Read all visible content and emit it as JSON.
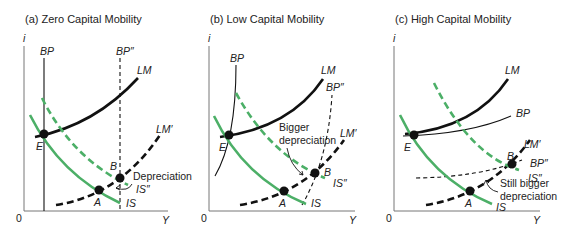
{
  "colors": {
    "is_curve": "#4caf67",
    "lm_curve": "#111111",
    "axis": "#777777"
  },
  "panels": [
    {
      "title": "(a) Zero Capital Mobility",
      "y_axis": "i",
      "x_axis": "Y",
      "origin": "0",
      "curves": {
        "bp": "BP",
        "bp2": "BP″",
        "lm": "LM",
        "lm2": "LM′",
        "is": "IS",
        "is2": "IS″"
      },
      "points": {
        "e": "E",
        "a": "A",
        "b": "B"
      },
      "note": "Depreciation"
    },
    {
      "title": "(b) Low Capital Mobility",
      "y_axis": "i",
      "x_axis": "Y",
      "origin": "0",
      "curves": {
        "bp": "BP",
        "bp2": "BP″",
        "lm": "LM",
        "lm2": "LM′",
        "is": "IS",
        "is2": "IS″"
      },
      "points": {
        "e": "E",
        "a": "A",
        "b": "B"
      },
      "note_line1": "Bigger",
      "note_line2": "depreciation"
    },
    {
      "title": "(c) High Capital Mobility",
      "y_axis": "i",
      "x_axis": "Y",
      "origin": "0",
      "curves": {
        "bp": "BP",
        "bp2": "BP″",
        "lm": "LM",
        "lm2": "LM′",
        "is": "IS",
        "is2": "IS″"
      },
      "points": {
        "e": "E",
        "a": "A",
        "b": "B"
      },
      "note_line1": "Still bigger",
      "note_line2": "depreciation"
    }
  ]
}
